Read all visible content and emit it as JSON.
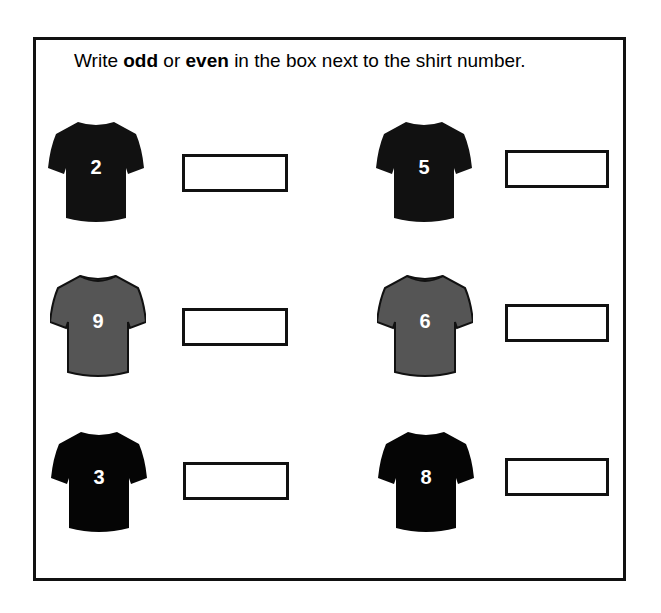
{
  "worksheet": {
    "instruction": {
      "prefix": "Write ",
      "odd": "odd",
      "middle": " or ",
      "even": "even",
      "suffix": " in the box next to the shirt number."
    },
    "shirts": [
      {
        "number": "2",
        "color": "#111111",
        "answer": ""
      },
      {
        "number": "5",
        "color": "#111111",
        "answer": ""
      },
      {
        "number": "9",
        "color": "#555555",
        "answer": ""
      },
      {
        "number": "6",
        "color": "#555555",
        "answer": ""
      },
      {
        "number": "3",
        "color": "#050505",
        "answer": ""
      },
      {
        "number": "8",
        "color": "#050505",
        "answer": ""
      }
    ]
  }
}
